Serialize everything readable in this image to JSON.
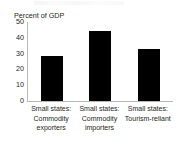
{
  "chart_data": {
    "type": "bar",
    "title": "",
    "ylabel": "Percent of GDP",
    "xlabel": "",
    "categories": [
      "Small states: Commodity exporters",
      "Small states: Commodity importers",
      "Small states: Tourism-reliant"
    ],
    "category_lines": [
      [
        "Small states:",
        "Commodity",
        "exporters"
      ],
      [
        "Small states:",
        "Commodity",
        "importers"
      ],
      [
        "Small states:",
        "Tourism-reliant"
      ]
    ],
    "values": [
      28.5,
      44.5,
      33
    ],
    "ylim": [
      0,
      50
    ],
    "yticks": [
      50,
      40,
      30,
      20,
      10,
      0
    ],
    "ytick_labels": [
      "50",
      "40",
      "30",
      "20",
      "10",
      "0"
    ],
    "grid": false,
    "legend": null,
    "bar_color": "#000000",
    "axis_color": "#b9b9b9",
    "text_color": "#231f20",
    "background": "#ffffff"
  }
}
